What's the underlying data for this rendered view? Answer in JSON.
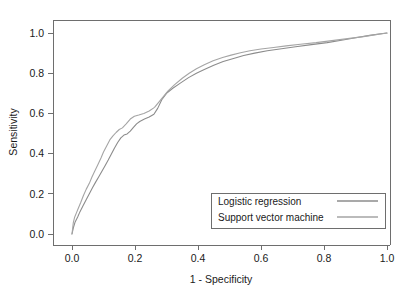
{
  "chart_data": {
    "type": "line",
    "title": "",
    "xlabel": "1 - Specificity",
    "ylabel": "Sensitivity",
    "xlim": [
      0.0,
      1.0
    ],
    "ylim": [
      0.0,
      1.0
    ],
    "grid": false,
    "legend_position": "lower-right",
    "xticks": [
      "0.0",
      "0.2",
      "0.4",
      "0.6",
      "0.8",
      "1.0"
    ],
    "xtick_values": [
      0.0,
      0.2,
      0.4,
      0.6,
      0.8,
      1.0
    ],
    "yticks": [
      "0.0",
      "0.2",
      "0.4",
      "0.6",
      "0.8",
      "1.0"
    ],
    "ytick_values": [
      0.0,
      0.2,
      0.4,
      0.6,
      0.8,
      1.0
    ],
    "series": [
      {
        "name": "Logistic regression",
        "color": "#8c8c8c",
        "x": [
          0.0,
          0.005,
          0.01,
          0.018,
          0.025,
          0.035,
          0.045,
          0.055,
          0.065,
          0.075,
          0.085,
          0.095,
          0.105,
          0.115,
          0.125,
          0.135,
          0.145,
          0.155,
          0.165,
          0.175,
          0.185,
          0.195,
          0.205,
          0.215,
          0.23,
          0.245,
          0.26,
          0.272,
          0.285,
          0.3,
          0.32,
          0.345,
          0.37,
          0.395,
          0.42,
          0.45,
          0.48,
          0.51,
          0.545,
          0.58,
          0.62,
          0.665,
          0.71,
          0.76,
          0.81,
          0.86,
          0.905,
          0.945,
          0.975,
          1.0
        ],
        "y": [
          0.0,
          0.035,
          0.06,
          0.085,
          0.11,
          0.14,
          0.17,
          0.2,
          0.23,
          0.258,
          0.285,
          0.312,
          0.34,
          0.368,
          0.398,
          0.428,
          0.455,
          0.478,
          0.492,
          0.498,
          0.512,
          0.53,
          0.548,
          0.56,
          0.572,
          0.582,
          0.596,
          0.625,
          0.668,
          0.7,
          0.725,
          0.752,
          0.778,
          0.8,
          0.818,
          0.84,
          0.858,
          0.872,
          0.888,
          0.9,
          0.912,
          0.922,
          0.932,
          0.942,
          0.952,
          0.965,
          0.978,
          0.988,
          0.995,
          1.0
        ]
      },
      {
        "name": "Support vector machine",
        "color": "#a5a5a5",
        "x": [
          0.0,
          0.004,
          0.008,
          0.014,
          0.02,
          0.028,
          0.036,
          0.045,
          0.055,
          0.063,
          0.072,
          0.082,
          0.092,
          0.1,
          0.11,
          0.12,
          0.13,
          0.14,
          0.15,
          0.16,
          0.172,
          0.185,
          0.198,
          0.212,
          0.228,
          0.245,
          0.262,
          0.275,
          0.288,
          0.305,
          0.325,
          0.35,
          0.372,
          0.395,
          0.42,
          0.448,
          0.478,
          0.505,
          0.535,
          0.565,
          0.6,
          0.64,
          0.68,
          0.725,
          0.775,
          0.825,
          0.875,
          0.925,
          0.965,
          1.0
        ],
        "y": [
          0.0,
          0.055,
          0.082,
          0.105,
          0.128,
          0.158,
          0.19,
          0.222,
          0.252,
          0.282,
          0.312,
          0.345,
          0.378,
          0.408,
          0.438,
          0.468,
          0.488,
          0.505,
          0.52,
          0.528,
          0.548,
          0.572,
          0.586,
          0.592,
          0.6,
          0.612,
          0.63,
          0.655,
          0.68,
          0.712,
          0.742,
          0.775,
          0.8,
          0.822,
          0.842,
          0.862,
          0.878,
          0.89,
          0.902,
          0.912,
          0.92,
          0.928,
          0.936,
          0.944,
          0.952,
          0.962,
          0.972,
          0.982,
          0.992,
          1.0
        ]
      }
    ]
  },
  "legend": {
    "entries": [
      {
        "label": "Logistic regression"
      },
      {
        "label": "Support vector machine"
      }
    ]
  },
  "axes": {
    "x_title": "1 - Specificity",
    "y_title": "Sensitivity"
  }
}
